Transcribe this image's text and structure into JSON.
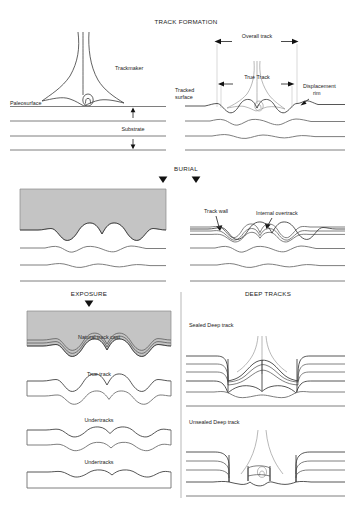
{
  "figure": {
    "width": 352,
    "height": 510,
    "background_color": "#ffffff",
    "sediment_fill_color": "#c4c4c4",
    "line_color": "#6f6f6f",
    "text_color": "#1b1b1b"
  },
  "sections": {
    "track_formation": {
      "title": "TRACK FORMATION",
      "left_panel": {
        "labels": {
          "trackmaker": "Trackmaker",
          "paleosurface": "Paleosurface",
          "substrate": "Substrate"
        }
      },
      "right_panel": {
        "labels": {
          "overall_track": "Overall track",
          "true_track": "True Track",
          "tracked_surface_line1": "Tracked",
          "tracked_surface_line2": "surface",
          "displacement_rim_line1": "Displacement",
          "displacement_rim_line2": "rim"
        }
      }
    },
    "burial": {
      "title": "BURIAL",
      "right_panel": {
        "labels": {
          "track_wall": "Track wall",
          "internal_overtrack": "Internal overtrack"
        }
      }
    },
    "exposure": {
      "title": "EXPOSURE",
      "labels": {
        "natural_track_cast": "Natural track cast",
        "true_track": "True track",
        "undertracks_upper": "Undertracks",
        "undertracks_lower": "Undertracks"
      }
    },
    "deep_tracks": {
      "title": "DEEP TRACKS",
      "labels": {
        "sealed_deep_track": "Sealed Deep track",
        "unsealed_deep_track": "Unsealed Deep track"
      }
    }
  }
}
